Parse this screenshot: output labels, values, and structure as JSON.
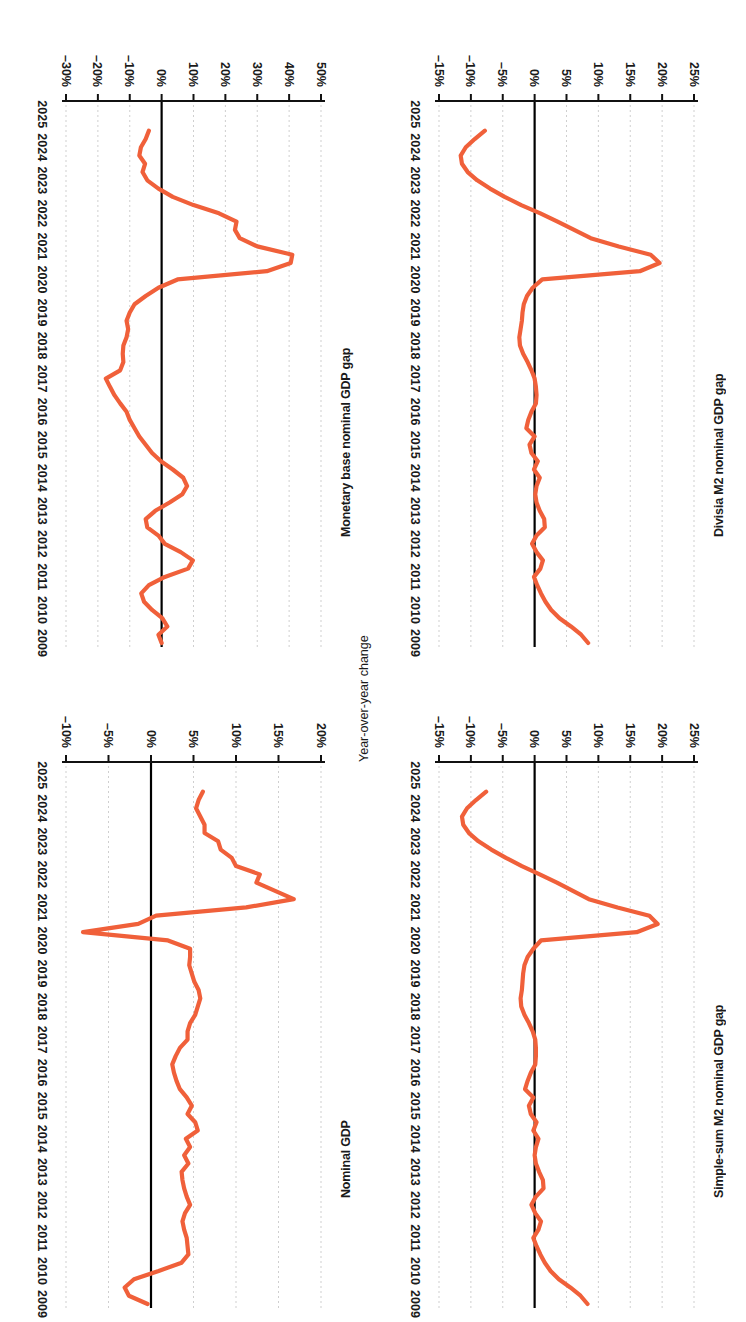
{
  "figure": {
    "orientation": "rotated-180",
    "accent_color": "#F0603A",
    "axis_color": "#1a1a1a",
    "grid_color": "#cfcfcf",
    "background": "#ffffff",
    "shared_axis_label": "Year-over-year change",
    "year_ticks": [
      "2009",
      "2010",
      "2011",
      "2012",
      "2013",
      "2014",
      "2015",
      "2016",
      "2017",
      "2018",
      "2019",
      "2020",
      "2021",
      "2022",
      "2023",
      "2024",
      "2025"
    ]
  },
  "chart_data": [
    {
      "panel": "bottom-left",
      "type": "line",
      "title": "Nominal GDP",
      "xlabel": "",
      "ylabel": "Year-over-year change",
      "ylim": [
        -10,
        20
      ],
      "yticks": [
        20,
        15,
        10,
        5,
        0,
        -5,
        -10
      ],
      "ytick_labels": [
        "20%",
        "15%",
        "10%",
        "5%",
        "0%",
        "–5%",
        "–10%"
      ],
      "xlim": [
        2009,
        2025.4
      ],
      "xticks": [
        2009,
        2010,
        2011,
        2012,
        2013,
        2014,
        2015,
        2016,
        2017,
        2018,
        2019,
        2020,
        2021,
        2022,
        2023,
        2024,
        2025
      ],
      "grid": true,
      "zero_line": true,
      "legend": "none",
      "x": [
        2009.0,
        2009.25,
        2009.5,
        2009.75,
        2010.0,
        2010.25,
        2010.5,
        2010.75,
        2011.0,
        2011.25,
        2011.5,
        2011.75,
        2012.0,
        2012.25,
        2012.5,
        2012.75,
        2013.0,
        2013.25,
        2013.5,
        2013.75,
        2014.0,
        2014.25,
        2014.5,
        2014.75,
        2015.0,
        2015.25,
        2015.5,
        2015.75,
        2016.0,
        2016.25,
        2016.5,
        2016.75,
        2017.0,
        2017.25,
        2017.5,
        2017.75,
        2018.0,
        2018.25,
        2018.5,
        2018.75,
        2019.0,
        2019.25,
        2019.5,
        2019.75,
        2020.0,
        2020.25,
        2020.5,
        2020.75,
        2021.0,
        2021.25,
        2021.5,
        2021.75,
        2022.0,
        2022.25,
        2022.5,
        2022.75,
        2023.0,
        2023.25,
        2023.5,
        2023.75,
        2024.0,
        2024.25,
        2024.5
      ],
      "values": [
        -0.4,
        -2.6,
        -3.1,
        -2.0,
        0.9,
        3.6,
        4.4,
        4.3,
        4.2,
        3.9,
        3.7,
        4.0,
        4.6,
        4.2,
        3.9,
        3.7,
        3.6,
        4.4,
        3.9,
        4.6,
        4.1,
        5.5,
        5.2,
        4.3,
        4.8,
        4.2,
        3.4,
        3.0,
        2.7,
        2.5,
        2.9,
        3.4,
        4.3,
        4.3,
        4.6,
        5.2,
        5.5,
        5.8,
        5.6,
        5.1,
        4.8,
        4.5,
        4.6,
        4.6,
        2.0,
        -8.0,
        -1.5,
        0.6,
        11.2,
        16.8,
        14.6,
        12.4,
        12.8,
        10.0,
        9.5,
        8.2,
        7.9,
        6.3,
        6.3,
        5.8,
        5.3,
        5.6,
        6.1
      ]
    },
    {
      "panel": "top-left",
      "type": "line",
      "title": "Monetary base nominal GDP gap",
      "xlabel": "",
      "ylabel": "",
      "ylim": [
        -30,
        50
      ],
      "yticks": [
        50,
        40,
        30,
        20,
        10,
        0,
        -10,
        -20,
        -30
      ],
      "ytick_labels": [
        "50%",
        "40%",
        "30%",
        "20%",
        "10%",
        "0%",
        "–10%",
        "–20%",
        "–30%"
      ],
      "xlim": [
        2009,
        2025.4
      ],
      "xticks": [
        2009,
        2010,
        2011,
        2012,
        2013,
        2014,
        2015,
        2016,
        2017,
        2018,
        2019,
        2020,
        2021,
        2022,
        2023,
        2024,
        2025
      ],
      "grid": true,
      "zero_line": true,
      "legend": "none",
      "x": [
        2009.0,
        2009.25,
        2009.5,
        2009.75,
        2010.0,
        2010.25,
        2010.5,
        2010.75,
        2011.0,
        2011.25,
        2011.5,
        2011.75,
        2012.0,
        2012.25,
        2012.5,
        2012.75,
        2013.0,
        2013.25,
        2013.5,
        2013.75,
        2014.0,
        2014.25,
        2014.5,
        2014.75,
        2015.0,
        2015.25,
        2015.5,
        2015.75,
        2016.0,
        2016.25,
        2016.5,
        2016.75,
        2017.0,
        2017.25,
        2017.5,
        2017.75,
        2018.0,
        2018.25,
        2018.5,
        2018.75,
        2019.0,
        2019.25,
        2019.5,
        2019.75,
        2020.0,
        2020.25,
        2020.5,
        2020.75,
        2021.0,
        2021.25,
        2021.5,
        2021.75,
        2022.0,
        2022.25,
        2022.5,
        2022.75,
        2023.0,
        2023.25,
        2023.5,
        2023.75,
        2024.0,
        2024.25,
        2024.5
      ],
      "values": [
        0.0,
        -1.0,
        1.8,
        0.2,
        -3.0,
        -5.5,
        -6.4,
        -4.0,
        1.0,
        8.3,
        9.8,
        6.0,
        1.0,
        -1.0,
        -4.5,
        -5.0,
        -2.0,
        2.5,
        6.5,
        8.0,
        6.8,
        3.5,
        -0.2,
        -3.0,
        -5.0,
        -7.0,
        -8.5,
        -10.0,
        -11.0,
        -13.0,
        -14.8,
        -16.2,
        -17.5,
        -13.0,
        -12.0,
        -12.2,
        -12.0,
        -11.0,
        -10.5,
        -11.0,
        -10.0,
        -8.5,
        -5.0,
        -1.0,
        5.0,
        33.0,
        40.5,
        41.0,
        30.0,
        24.5,
        23.0,
        23.5,
        18.0,
        10.0,
        3.5,
        -1.0,
        -4.5,
        -6.0,
        -5.2,
        -7.0,
        -6.5,
        -5.0,
        -4.0
      ]
    },
    {
      "panel": "bottom-right",
      "type": "line",
      "title": "Simple-sum M2 nominal GDP gap",
      "xlabel": "",
      "ylabel": "",
      "ylim": [
        -15,
        25
      ],
      "yticks": [
        25,
        20,
        15,
        10,
        5,
        0,
        -5,
        -10,
        -15
      ],
      "ytick_labels": [
        "25%",
        "20%",
        "15%",
        "10%",
        "5%",
        "0%",
        "–5%",
        "–10%",
        "–15%"
      ],
      "xlim": [
        2009,
        2025.4
      ],
      "xticks": [
        2009,
        2010,
        2011,
        2012,
        2013,
        2014,
        2015,
        2016,
        2017,
        2018,
        2019,
        2020,
        2021,
        2022,
        2023,
        2024,
        2025
      ],
      "grid": true,
      "zero_line": true,
      "legend": "none",
      "x": [
        2009.0,
        2009.25,
        2009.5,
        2009.75,
        2010.0,
        2010.25,
        2010.5,
        2010.75,
        2011.0,
        2011.25,
        2011.5,
        2011.75,
        2012.0,
        2012.25,
        2012.5,
        2012.75,
        2013.0,
        2013.25,
        2013.5,
        2013.75,
        2014.0,
        2014.25,
        2014.5,
        2014.75,
        2015.0,
        2015.25,
        2015.5,
        2015.75,
        2016.0,
        2016.25,
        2016.5,
        2016.75,
        2017.0,
        2017.25,
        2017.5,
        2017.75,
        2018.0,
        2018.25,
        2018.5,
        2018.75,
        2019.0,
        2019.25,
        2019.5,
        2019.75,
        2020.0,
        2020.25,
        2020.5,
        2020.75,
        2021.0,
        2021.25,
        2021.5,
        2021.75,
        2022.0,
        2022.25,
        2022.5,
        2022.75,
        2023.0,
        2023.25,
        2023.5,
        2023.75,
        2024.0,
        2024.25,
        2024.5
      ],
      "values": [
        8.3,
        7.2,
        5.6,
        3.8,
        2.5,
        1.6,
        0.9,
        0.3,
        -0.2,
        0.6,
        1.0,
        0.1,
        -0.5,
        0.2,
        1.4,
        1.3,
        0.7,
        0.2,
        0.0,
        0.2,
        0.6,
        -0.2,
        0.3,
        -0.6,
        -0.9,
        -0.2,
        -1.5,
        -1.1,
        -0.6,
        0.1,
        0.2,
        0.2,
        0.1,
        -0.3,
        -0.9,
        -1.6,
        -2.1,
        -2.2,
        -2.0,
        -1.9,
        -1.8,
        -1.6,
        -1.1,
        -0.2,
        1.0,
        16.0,
        19.3,
        18.0,
        13.0,
        8.5,
        6.0,
        3.5,
        0.8,
        -2.0,
        -4.5,
        -6.8,
        -8.8,
        -10.3,
        -11.2,
        -11.4,
        -10.6,
        -9.2,
        -7.6
      ]
    },
    {
      "panel": "top-right",
      "type": "line",
      "title": "Divisia M2 nominal GDP gap",
      "xlabel": "",
      "ylabel": "",
      "ylim": [
        -15,
        25
      ],
      "yticks": [
        25,
        20,
        15,
        10,
        5,
        0,
        -5,
        -10,
        -15
      ],
      "ytick_labels": [
        "25%",
        "20%",
        "15%",
        "10%",
        "5%",
        "0%",
        "–5%",
        "–10%",
        "–15%"
      ],
      "xlim": [
        2009,
        2025.4
      ],
      "xticks": [
        2009,
        2010,
        2011,
        2012,
        2013,
        2014,
        2015,
        2016,
        2017,
        2018,
        2019,
        2020,
        2021,
        2022,
        2023,
        2024,
        2025
      ],
      "grid": true,
      "zero_line": true,
      "legend": "none",
      "x": [
        2009.0,
        2009.25,
        2009.5,
        2009.75,
        2010.0,
        2010.25,
        2010.5,
        2010.75,
        2011.0,
        2011.25,
        2011.5,
        2011.75,
        2012.0,
        2012.25,
        2012.5,
        2012.75,
        2013.0,
        2013.25,
        2013.5,
        2013.75,
        2014.0,
        2014.25,
        2014.5,
        2014.75,
        2015.0,
        2015.25,
        2015.5,
        2015.75,
        2016.0,
        2016.25,
        2016.5,
        2016.75,
        2017.0,
        2017.25,
        2017.5,
        2017.75,
        2018.0,
        2018.25,
        2018.5,
        2018.75,
        2019.0,
        2019.25,
        2019.5,
        2019.75,
        2020.0,
        2020.25,
        2020.5,
        2020.75,
        2021.0,
        2021.25,
        2021.5,
        2021.75,
        2022.0,
        2022.25,
        2022.5,
        2022.75,
        2023.0,
        2023.25,
        2023.5,
        2023.75,
        2024.0,
        2024.25,
        2024.5
      ],
      "values": [
        8.4,
        7.3,
        5.7,
        3.9,
        2.6,
        1.7,
        1.0,
        0.4,
        -0.1,
        0.9,
        1.3,
        0.3,
        -0.4,
        0.3,
        1.6,
        1.5,
        0.8,
        0.3,
        0.1,
        0.3,
        0.8,
        -0.1,
        0.5,
        -0.5,
        -0.8,
        0.0,
        -1.3,
        -1.0,
        -0.5,
        0.2,
        0.3,
        0.2,
        0.0,
        -0.5,
        -1.1,
        -1.8,
        -2.3,
        -2.4,
        -2.2,
        -2.0,
        -1.9,
        -1.7,
        -1.2,
        -0.3,
        1.2,
        16.5,
        19.6,
        18.2,
        13.2,
        8.8,
        6.2,
        3.6,
        0.9,
        -2.1,
        -4.7,
        -7.0,
        -9.0,
        -10.5,
        -11.4,
        -11.6,
        -10.8,
        -9.4,
        -7.8
      ]
    }
  ]
}
